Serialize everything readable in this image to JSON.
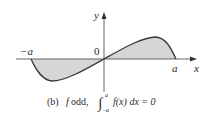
{
  "figure": {
    "caption_prefix": "(b)",
    "caption_f": "f",
    "caption_text": " odd, ",
    "caption_integrand": "f(x) dx = 0",
    "integral_upper": "a",
    "integral_lower": "−a",
    "axis_x_label": "x",
    "axis_y_label": "y",
    "origin_label": "0",
    "left_limit_label": "−a",
    "right_limit_label": "a"
  },
  "colors": {
    "fill": "#d6d6d6",
    "curve": "#3a3a3a",
    "axis": "#555555"
  }
}
